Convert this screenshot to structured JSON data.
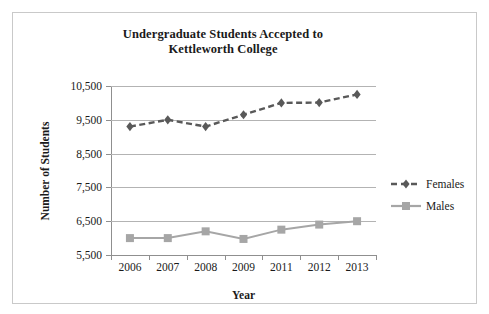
{
  "chart_data": {
    "type": "line",
    "title": "Undergraduate Students Accepted to Kettleworth College",
    "title_line1": "Undergraduate Students Accepted to",
    "title_line2": "Kettleworth College",
    "xlabel": "Year",
    "ylabel": "Number of Students",
    "categories": [
      "2006",
      "2007",
      "2008",
      "2009",
      "2011",
      "2012",
      "2013"
    ],
    "ylim": [
      5500,
      10500
    ],
    "yticks": [
      5500,
      6500,
      7500,
      8500,
      9500,
      10500
    ],
    "ytick_labels": [
      "5,500",
      "6,500",
      "7,500",
      "8,500",
      "9,500",
      "10,500"
    ],
    "grid": true,
    "legend_position": "right",
    "series": [
      {
        "name": "Females",
        "values": [
          9300,
          9500,
          9300,
          9650,
          10000,
          10010,
          10250
        ],
        "color": "#595959",
        "line_style": "dashed",
        "marker": "diamond"
      },
      {
        "name": "Males",
        "values": [
          6000,
          6000,
          6200,
          5975,
          6250,
          6400,
          6500
        ],
        "color": "#a6a6a6",
        "line_style": "solid",
        "marker": "square"
      }
    ]
  },
  "colors": {
    "females": "#595959",
    "males": "#a6a6a6",
    "gridline": "#b3b3b3",
    "axis": "#8f8f8f",
    "frame": "#c9c9c9",
    "text": "#1a1a1a",
    "background": "#ffffff"
  }
}
